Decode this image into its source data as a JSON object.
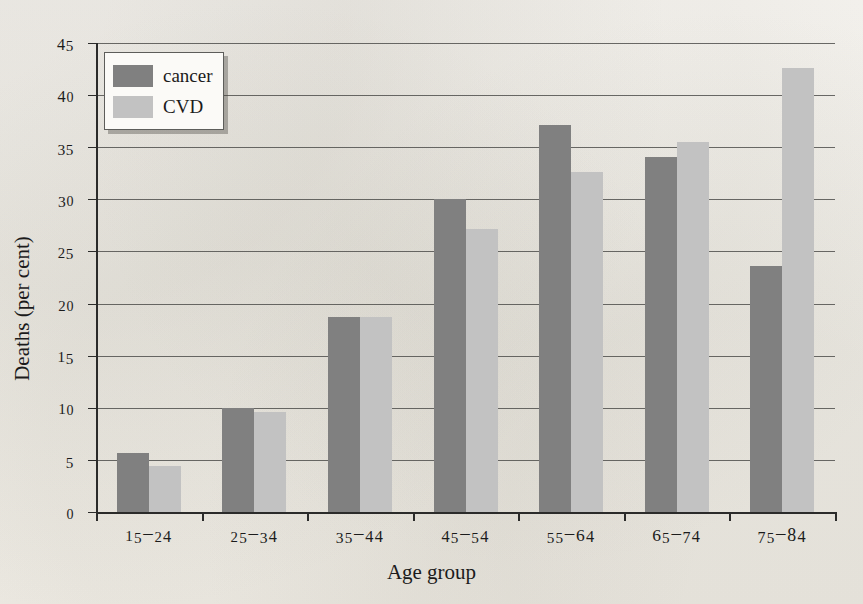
{
  "chart_data": {
    "type": "bar",
    "title": "",
    "xlabel": "Age group",
    "ylabel": "Deaths (per cent)",
    "categories": [
      "15-24",
      "25-34",
      "35-44",
      "45-54",
      "55-64",
      "65-74",
      "75-84"
    ],
    "series": [
      {
        "name": "cancer",
        "color": "#808080",
        "values": [
          5.7,
          10.0,
          18.7,
          30.0,
          37.1,
          34.1,
          23.6
        ]
      },
      {
        "name": "CVD",
        "color": "#c2c2c2",
        "values": [
          4.4,
          9.6,
          18.7,
          27.2,
          32.6,
          35.5,
          42.6
        ]
      }
    ],
    "ylim": [
      0,
      45
    ],
    "ytick_values": [
      0,
      5,
      10,
      15,
      20,
      25,
      30,
      35,
      40,
      45
    ],
    "ytick_labels": [
      "0",
      "5",
      "10",
      "15",
      "20",
      "25",
      "30",
      "35",
      "40",
      "45"
    ],
    "grid": "horizontal",
    "legend_position": "top-left"
  },
  "legend": {
    "entries": [
      {
        "label": "cancer"
      },
      {
        "label": "CVD"
      }
    ]
  },
  "axes": {
    "x_title": "Age group",
    "y_title": "Deaths (per cent)"
  }
}
